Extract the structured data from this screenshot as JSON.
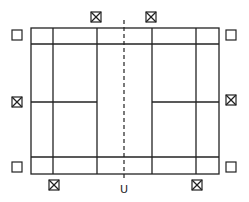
{
  "diagram": {
    "type": "badminton-court-positions",
    "colors": {
      "stroke": "#222222",
      "background": "#ffffff"
    },
    "court": {
      "outer": {
        "x1": 31,
        "y1": 28,
        "x2": 219,
        "y2": 174
      },
      "sideline_top_y": 44,
      "sideline_bottom_y": 157,
      "vertical_lines_x": [
        53,
        97,
        152,
        196
      ],
      "net_x": 124,
      "center_service_y": 102
    },
    "markers": [
      {
        "kind": "empty-box",
        "x": 17,
        "y": 35
      },
      {
        "kind": "empty-box",
        "x": 231,
        "y": 35
      },
      {
        "kind": "empty-box",
        "x": 17,
        "y": 167
      },
      {
        "kind": "empty-box",
        "x": 231,
        "y": 167
      },
      {
        "kind": "crossed-box",
        "x": 96,
        "y": 17
      },
      {
        "kind": "crossed-box",
        "x": 151,
        "y": 17
      },
      {
        "kind": "crossed-box",
        "x": 17,
        "y": 102
      },
      {
        "kind": "crossed-box",
        "x": 231,
        "y": 100
      },
      {
        "kind": "crossed-box",
        "x": 54,
        "y": 185
      },
      {
        "kind": "crossed-box",
        "x": 197,
        "y": 185
      }
    ],
    "umpire_label": "U"
  }
}
